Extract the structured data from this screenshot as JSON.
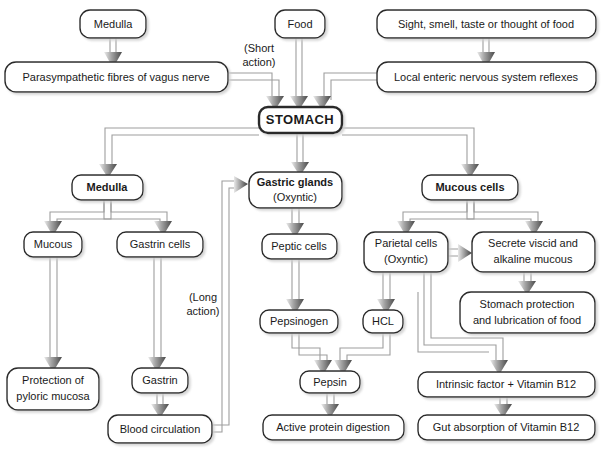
{
  "diagram": {
    "colors": {
      "background": "#ffffff",
      "box_fill": "#ffffff",
      "box_stroke": "#2b2b2b",
      "text": "#1a1a1a",
      "arrow_dark": "#4a4a4a",
      "connector_line": "#9a9a9a",
      "shadow": "#c8c8c8"
    },
    "nodes": {
      "medulla_top": "Medulla",
      "food": "Food",
      "sight": "Sight, smell, taste or thought of food",
      "vagus": "Parasympathetic fibres of vagus nerve",
      "local_reflexes": "Local enteric nervous system reflexes",
      "stomach": "STOMACH",
      "medulla_mid": "Medulla",
      "gastric_glands_line1": "Gastric glands",
      "gastric_glands_line2": "(Oxyntic)",
      "mucous_cells": "Mucous cells",
      "mucous": "Mucous",
      "gastrin_cells": "Gastrin cells",
      "peptic_cells": "Peptic cells",
      "parietal_line1": "Parietal cells",
      "parietal_line2": "(Oxyntic)",
      "secrete_line1": "Secrete viscid and",
      "secrete_line2": "alkaline mucous",
      "pepsinogen": "Pepsinogen",
      "hcl": "HCL",
      "stomach_protection_line1": "Stomach protection",
      "stomach_protection_line2": "and lubrication of food",
      "protection_line1": "Protection of",
      "protection_line2": "pyloric mucosa",
      "gastrin": "Gastrin",
      "pepsin": "Pepsin",
      "intrinsic_factor": "Intrinsic factor + Vitamin B12",
      "blood_circulation": "Blood circulation",
      "active_protein": "Active protein digestion",
      "gut_absorption": "Gut absorption of Vitamin B12"
    },
    "annotations": {
      "short_action_line1": "(Short",
      "short_action_line2": "action)",
      "long_action_line1": "(Long",
      "long_action_line2": "action)"
    }
  }
}
